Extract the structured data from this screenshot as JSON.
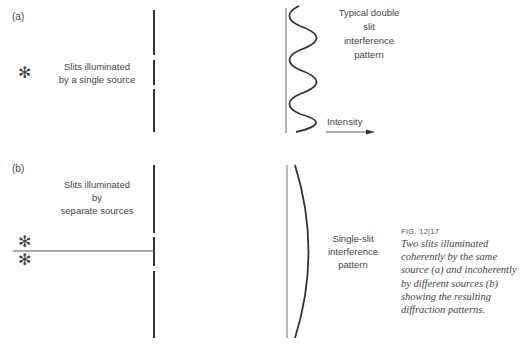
{
  "panel_a": {
    "label": "(a)",
    "source_label": "Slits illuminated\nby a single source",
    "source_label_lines": [
      "Slits illuminated",
      "by a single source"
    ],
    "source_icon": "asterisk-icon",
    "pattern_label_lines": [
      "Typical double",
      "slit",
      "interference",
      "pattern"
    ],
    "axis_label": "Intensity"
  },
  "panel_b": {
    "label": "(b)",
    "source_label_lines": [
      "Slits illuminated",
      "by",
      "separate sources"
    ],
    "source_icons": [
      "asterisk-icon",
      "asterisk-icon"
    ],
    "pattern_label_lines": [
      "Single-slit",
      "interference",
      "pattern"
    ]
  },
  "caption": {
    "figure_number": "FIG. 12|17",
    "text": "Two slits illuminated coherently by the same source (a) and incoherently by different sources (b) showing the resulting diffraction patterns."
  },
  "colors": {
    "line": "#333333",
    "text": "#444444",
    "background": "#ffffff"
  }
}
